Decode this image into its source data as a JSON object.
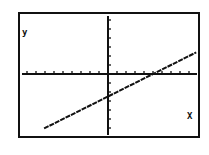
{
  "chart_data": {
    "type": "line",
    "title": "",
    "xlabel": "X",
    "ylabel": "y",
    "xlim": [
      -10,
      10
    ],
    "ylim": [
      -7,
      7
    ],
    "xscale": 1,
    "yscale": 1,
    "grid": false,
    "series": [
      {
        "name": "y = 0.5x - 2.5",
        "x": [
          -7,
          -4,
          0,
          5,
          10
        ],
        "y": [
          -6,
          -4.5,
          -2.5,
          0,
          2.5
        ]
      }
    ],
    "annotations": {
      "y_intercept": -2.5,
      "x_intercept": 5
    }
  },
  "labels": {
    "x_axis": "X",
    "y_axis": "y"
  },
  "colors": {
    "background": "#ffffff",
    "ink": "#111111"
  }
}
